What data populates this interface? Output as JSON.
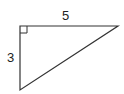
{
  "diagram": {
    "type": "right-triangle",
    "labels": {
      "top_side": "5",
      "left_side": "3"
    },
    "right_angle_marker": "top-left",
    "colors": {
      "stroke": "#333333",
      "text": "#222222",
      "background": "#ffffff"
    }
  }
}
